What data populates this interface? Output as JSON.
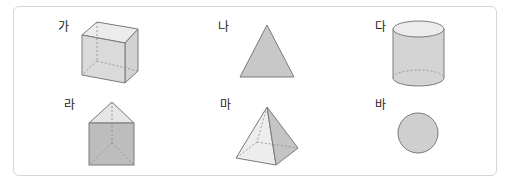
{
  "figures": [
    {
      "label": "가",
      "shape": "cube"
    },
    {
      "label": "나",
      "shape": "triangle"
    },
    {
      "label": "다",
      "shape": "cylinder"
    },
    {
      "label": "라",
      "shape": "triangular-prism"
    },
    {
      "label": "마",
      "shape": "square-pyramid"
    },
    {
      "label": "바",
      "shape": "circle"
    }
  ],
  "colors": {
    "border": "#d6d6d6",
    "stroke": "#7a7a7a",
    "fill_dark": "#c4c4c4",
    "fill_mid": "#d4d4d4",
    "fill_light": "#e6e6e6",
    "fill_lighter": "#efefef"
  }
}
